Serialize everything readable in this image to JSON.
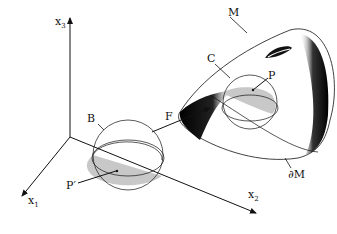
{
  "figure": {
    "type": "manifold-chart-mapping-diagram",
    "labels": {
      "x1": "x",
      "x1_sub": "1",
      "x2": "x",
      "x2_sub": "2",
      "x3": "x",
      "x3_sub": "3",
      "M": "M",
      "boundary": "∂M",
      "C": "C",
      "P": "P",
      "B": "B",
      "P_prime": "P′",
      "F": "F"
    },
    "colors": {
      "ink": "#111111",
      "shade": "#c8c8c8",
      "dark": "#000000"
    }
  }
}
